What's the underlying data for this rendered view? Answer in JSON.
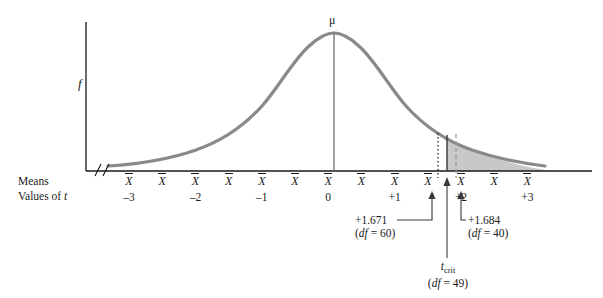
{
  "axes": {
    "y_axis_label": "f",
    "row_label_means": "Means",
    "row_label_values_prefix": "Values of ",
    "row_label_values_var": "t",
    "mean_symbol": "μ",
    "mean_tick_symbol": "X",
    "break_mark": "//"
  },
  "annotations": {
    "left": {
      "value": "+1.671",
      "df_prefix": "df",
      "df_text": "(df = 60)",
      "df_value": "60"
    },
    "right": {
      "value": "+1.684",
      "df_text": "(df = 40)",
      "df_value": "40"
    },
    "critical": {
      "symbol": "t",
      "subscript": "crit",
      "df_text": "(df = 49)",
      "df_value": "49"
    }
  },
  "colors": {
    "curve": "#8a8a8a",
    "shade": "#c8c8c8",
    "axis": "#1a1a1a",
    "text": "#1a1a1a"
  },
  "chart_data": {
    "type": "line",
    "title": "",
    "xlabel": "Values of t",
    "ylabel": "f",
    "xlim": [
      -3.5,
      3.5
    ],
    "ylim": [
      0,
      1
    ],
    "grid": false,
    "legend": "none",
    "distribution": "t-distribution sampling distribution of means",
    "tick_labels_xbar": [
      "X",
      "X",
      "X",
      "X",
      "X",
      "X",
      "X",
      "X",
      "X",
      "X",
      "X",
      "X",
      "X"
    ],
    "tick_values_t": [
      -3,
      -2.5,
      -2,
      -1.5,
      -1,
      -0.5,
      0,
      0.5,
      1,
      1.5,
      2,
      2.5,
      3
    ],
    "tick_labels_t": [
      "-3",
      "",
      "-2",
      "",
      "-1",
      "",
      "0",
      "",
      "+1",
      "",
      "+2",
      "",
      "+3"
    ],
    "mean_line_t": 0,
    "vertical_markers": [
      {
        "label": "+1.671",
        "t": 1.671,
        "style": "dotted",
        "df": 60
      },
      {
        "label": "t_crit",
        "t": 1.8,
        "style": "solid",
        "df": 49
      },
      {
        "label": "+1.684",
        "t": 1.684,
        "style": "dashed",
        "df": 40
      }
    ],
    "shaded_region": {
      "from_t": 1.8,
      "to_t": 3.5,
      "label": "rejection region"
    },
    "x": [
      -3.5,
      -3.25,
      -3,
      -2.75,
      -2.5,
      -2.25,
      -2,
      -1.75,
      -1.5,
      -1.25,
      -1,
      -0.75,
      -0.5,
      -0.25,
      0,
      0.25,
      0.5,
      0.75,
      1,
      1.25,
      1.5,
      1.75,
      2,
      2.25,
      2.5,
      2.75,
      3,
      3.25,
      3.5
    ],
    "y": [
      0.04,
      0.05,
      0.07,
      0.09,
      0.12,
      0.16,
      0.21,
      0.28,
      0.36,
      0.46,
      0.57,
      0.69,
      0.8,
      0.92,
      1.0,
      0.92,
      0.8,
      0.69,
      0.57,
      0.46,
      0.36,
      0.28,
      0.21,
      0.16,
      0.12,
      0.09,
      0.07,
      0.05,
      0.04
    ]
  }
}
